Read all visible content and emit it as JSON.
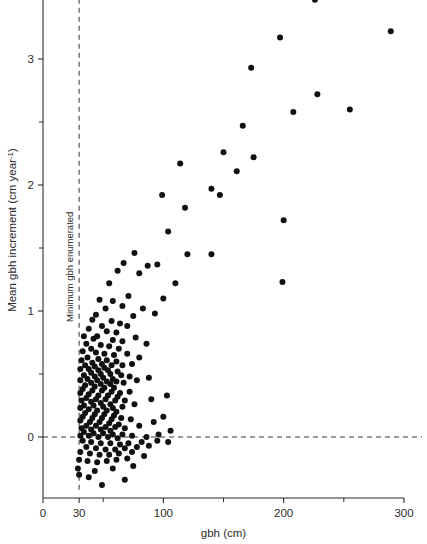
{
  "chart_data": {
    "type": "scatter",
    "title": "",
    "subtitle": "",
    "xlabel": "gbh (cm)",
    "ylabel": "Mean gbh increment (cm year⁻¹)",
    "ylabel_main": "Mean gbh increment (cm year",
    "ylabel_sup": "-1",
    "ylabel_tail": ")",
    "xlim": [
      0,
      305
    ],
    "ylim": [
      -0.55,
      3.55
    ],
    "grid": false,
    "legend": null,
    "x_ticks_major": [
      0,
      30,
      100,
      200,
      300
    ],
    "x_tick_labels": [
      "0",
      "30",
      "100",
      "200",
      "300"
    ],
    "x_ticks_minor": [
      50,
      150,
      250
    ],
    "y_ticks_major": [
      0,
      1,
      2,
      3
    ],
    "y_tick_labels": [
      "0",
      "1",
      "2",
      "3"
    ],
    "y_ticks_minor": [
      -0.5,
      0.5,
      1.5,
      2.5,
      3.5
    ],
    "annotations": [
      {
        "name": "minimum-gbh-enumerated",
        "text": "Minimum gbh enumerated",
        "type": "vertical-dashed-line",
        "x": 30
      },
      {
        "name": "zero-increment-line",
        "text": "",
        "type": "horizontal-dashed-line",
        "y": 0
      }
    ],
    "marker": {
      "shape": "circle",
      "color": "#111111",
      "size": 3.0
    },
    "points": [
      [
        226,
        3.47
      ],
      [
        289,
        3.22
      ],
      [
        197,
        3.17
      ],
      [
        173,
        2.93
      ],
      [
        228,
        2.72
      ],
      [
        208,
        2.58
      ],
      [
        255,
        2.6
      ],
      [
        166,
        2.47
      ],
      [
        150,
        2.26
      ],
      [
        175,
        2.22
      ],
      [
        200,
        1.72
      ],
      [
        161,
        2.11
      ],
      [
        140,
        1.97
      ],
      [
        147,
        1.92
      ],
      [
        114,
        2.17
      ],
      [
        118,
        1.82
      ],
      [
        104,
        1.63
      ],
      [
        99,
        1.92
      ],
      [
        120,
        1.45
      ],
      [
        140,
        1.45
      ],
      [
        199,
        1.23
      ],
      [
        87,
        1.36
      ],
      [
        110,
        1.22
      ],
      [
        95,
        1.37
      ],
      [
        76,
        1.46
      ],
      [
        80,
        1.3
      ],
      [
        67,
        1.38
      ],
      [
        62,
        1.32
      ],
      [
        55,
        1.22
      ],
      [
        100,
        1.1
      ],
      [
        71,
        1.12
      ],
      [
        58,
        1.08
      ],
      [
        66,
        1.04
      ],
      [
        52,
        1.02
      ],
      [
        47,
        1.09
      ],
      [
        83,
        1.02
      ],
      [
        93,
        0.98
      ],
      [
        75,
        0.96
      ],
      [
        44,
        0.97
      ],
      [
        41,
        0.93
      ],
      [
        57,
        0.92
      ],
      [
        64,
        0.9
      ],
      [
        70,
        0.88
      ],
      [
        49,
        0.88
      ],
      [
        38,
        0.86
      ],
      [
        53,
        0.84
      ],
      [
        61,
        0.83
      ],
      [
        45,
        0.8
      ],
      [
        34,
        0.8
      ],
      [
        42,
        0.78
      ],
      [
        58,
        0.77
      ],
      [
        66,
        0.76
      ],
      [
        77,
        0.79
      ],
      [
        86,
        0.74
      ],
      [
        36,
        0.74
      ],
      [
        48,
        0.73
      ],
      [
        55,
        0.72
      ],
      [
        63,
        0.7
      ],
      [
        40,
        0.7
      ],
      [
        33,
        0.68
      ],
      [
        44,
        0.67
      ],
      [
        51,
        0.66
      ],
      [
        59,
        0.65
      ],
      [
        70,
        0.66
      ],
      [
        80,
        0.63
      ],
      [
        37,
        0.63
      ],
      [
        46,
        0.62
      ],
      [
        53,
        0.61
      ],
      [
        61,
        0.6
      ],
      [
        32,
        0.61
      ],
      [
        41,
        0.59
      ],
      [
        49,
        0.58
      ],
      [
        57,
        0.57
      ],
      [
        66,
        0.57
      ],
      [
        74,
        0.58
      ],
      [
        35,
        0.57
      ],
      [
        43,
        0.56
      ],
      [
        51,
        0.55
      ],
      [
        38,
        0.54
      ],
      [
        46,
        0.53
      ],
      [
        54,
        0.53
      ],
      [
        62,
        0.52
      ],
      [
        31,
        0.54
      ],
      [
        40,
        0.51
      ],
      [
        48,
        0.5
      ],
      [
        56,
        0.5
      ],
      [
        65,
        0.49
      ],
      [
        72,
        0.48
      ],
      [
        34,
        0.49
      ],
      [
        43,
        0.48
      ],
      [
        50,
        0.47
      ],
      [
        58,
        0.46
      ],
      [
        37,
        0.46
      ],
      [
        45,
        0.45
      ],
      [
        53,
        0.44
      ],
      [
        61,
        0.44
      ],
      [
        31,
        0.45
      ],
      [
        40,
        0.43
      ],
      [
        48,
        0.42
      ],
      [
        56,
        0.42
      ],
      [
        67,
        0.43
      ],
      [
        78,
        0.45
      ],
      [
        88,
        0.47
      ],
      [
        35,
        0.41
      ],
      [
        43,
        0.4
      ],
      [
        51,
        0.39
      ],
      [
        59,
        0.39
      ],
      [
        33,
        0.38
      ],
      [
        41,
        0.37
      ],
      [
        49,
        0.37
      ],
      [
        57,
        0.36
      ],
      [
        64,
        0.35
      ],
      [
        72,
        0.36
      ],
      [
        31,
        0.35
      ],
      [
        38,
        0.34
      ],
      [
        46,
        0.33
      ],
      [
        54,
        0.33
      ],
      [
        62,
        0.32
      ],
      [
        36,
        0.31
      ],
      [
        44,
        0.3
      ],
      [
        52,
        0.3
      ],
      [
        60,
        0.29
      ],
      [
        68,
        0.29
      ],
      [
        32,
        0.29
      ],
      [
        40,
        0.28
      ],
      [
        48,
        0.27
      ],
      [
        56,
        0.26
      ],
      [
        34,
        0.25
      ],
      [
        42,
        0.25
      ],
      [
        50,
        0.24
      ],
      [
        58,
        0.23
      ],
      [
        66,
        0.24
      ],
      [
        76,
        0.26
      ],
      [
        90,
        0.3
      ],
      [
        103,
        0.33
      ],
      [
        31,
        0.23
      ],
      [
        38,
        0.22
      ],
      [
        45,
        0.21
      ],
      [
        53,
        0.21
      ],
      [
        61,
        0.2
      ],
      [
        35,
        0.19
      ],
      [
        43,
        0.18
      ],
      [
        51,
        0.18
      ],
      [
        59,
        0.17
      ],
      [
        33,
        0.16
      ],
      [
        41,
        0.15
      ],
      [
        49,
        0.15
      ],
      [
        57,
        0.14
      ],
      [
        65,
        0.15
      ],
      [
        73,
        0.14
      ],
      [
        31,
        0.13
      ],
      [
        39,
        0.12
      ],
      [
        47,
        0.12
      ],
      [
        55,
        0.11
      ],
      [
        63,
        0.1
      ],
      [
        36,
        0.09
      ],
      [
        44,
        0.09
      ],
      [
        52,
        0.08
      ],
      [
        60,
        0.08
      ],
      [
        32,
        0.07
      ],
      [
        40,
        0.06
      ],
      [
        48,
        0.06
      ],
      [
        56,
        0.05
      ],
      [
        68,
        0.07
      ],
      [
        80,
        0.09
      ],
      [
        92,
        0.12
      ],
      [
        100,
        0.16
      ],
      [
        106,
        0.05
      ],
      [
        34,
        0.04
      ],
      [
        42,
        0.03
      ],
      [
        50,
        0.03
      ],
      [
        58,
        0.02
      ],
      [
        66,
        0.02
      ],
      [
        31,
        0.01
      ],
      [
        38,
        0.01
      ],
      [
        46,
        0.0
      ],
      [
        54,
        0.0
      ],
      [
        62,
        -0.01
      ],
      [
        74,
        0.01
      ],
      [
        86,
        0.0
      ],
      [
        96,
        0.02
      ],
      [
        33,
        -0.03
      ],
      [
        40,
        -0.04
      ],
      [
        48,
        -0.05
      ],
      [
        56,
        -0.05
      ],
      [
        64,
        -0.06
      ],
      [
        71,
        -0.05
      ],
      [
        82,
        -0.04
      ],
      [
        95,
        -0.03
      ],
      [
        104,
        -0.04
      ],
      [
        36,
        -0.08
      ],
      [
        44,
        -0.09
      ],
      [
        52,
        -0.1
      ],
      [
        60,
        -0.1
      ],
      [
        68,
        -0.09
      ],
      [
        78,
        -0.08
      ],
      [
        88,
        -0.07
      ],
      [
        31,
        -0.12
      ],
      [
        39,
        -0.13
      ],
      [
        47,
        -0.14
      ],
      [
        55,
        -0.14
      ],
      [
        63,
        -0.13
      ],
      [
        74,
        -0.12
      ],
      [
        30,
        -0.18
      ],
      [
        37,
        -0.19
      ],
      [
        45,
        -0.2
      ],
      [
        53,
        -0.19
      ],
      [
        61,
        -0.18
      ],
      [
        70,
        -0.17
      ],
      [
        84,
        -0.15
      ],
      [
        29,
        -0.25
      ],
      [
        43,
        -0.27
      ],
      [
        58,
        -0.25
      ],
      [
        75,
        -0.23
      ],
      [
        49,
        -0.38
      ],
      [
        68,
        -0.34
      ],
      [
        30,
        -0.3
      ],
      [
        38,
        -0.32
      ]
    ]
  },
  "layout": {
    "plot_left_px": 43,
    "plot_right_px": 404,
    "plot_bottom_px": 498,
    "plot_top_px": 13,
    "px_per_x": 1.2033,
    "px_per_y": 126.0,
    "y_zero_px": 437
  }
}
